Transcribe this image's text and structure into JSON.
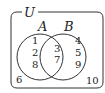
{
  "diagram": {
    "type": "venn",
    "universe": {
      "label": "U",
      "outside_elements": [
        "6",
        "10"
      ]
    },
    "sets": [
      {
        "label": "A",
        "only_elements": [
          "1",
          "2",
          "8"
        ]
      },
      {
        "label": "B",
        "only_elements": [
          "4",
          "5",
          "9"
        ]
      }
    ],
    "intersection": [
      "3",
      "7"
    ],
    "colors": {
      "stroke": "#333333",
      "text": "#222222",
      "background": "#ffffff"
    }
  }
}
